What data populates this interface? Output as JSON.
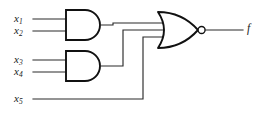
{
  "figure": {
    "kind": "logic-circuit-diagram",
    "colors": {
      "background": "#ffffff",
      "wire": "#2b2b2b",
      "gate_outline": "#111111",
      "label_text": "#1a1a1a"
    }
  },
  "inputs": [
    {
      "id": "x1",
      "base": "x",
      "sub": "1"
    },
    {
      "id": "x2",
      "base": "x",
      "sub": "2"
    },
    {
      "id": "x3",
      "base": "x",
      "sub": "3"
    },
    {
      "id": "x4",
      "base": "x",
      "sub": "4"
    },
    {
      "id": "x5",
      "base": "x",
      "sub": "5"
    }
  ],
  "output": {
    "id": "f",
    "label": "f"
  },
  "gates": [
    {
      "id": "and1",
      "type": "AND",
      "inputs": [
        "x1",
        "x2"
      ]
    },
    {
      "id": "and2",
      "type": "AND",
      "inputs": [
        "x3",
        "x4"
      ]
    },
    {
      "id": "nor1",
      "type": "NOR",
      "inputs": [
        "and1",
        "and2",
        "x5"
      ],
      "output": "f",
      "bubble": true
    }
  ]
}
